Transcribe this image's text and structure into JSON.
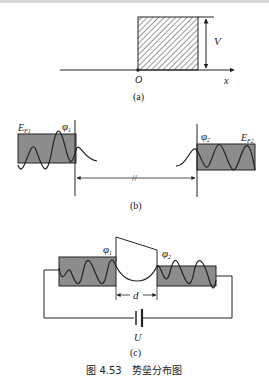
{
  "header_fragment": "",
  "panel_a": {
    "label": "(a)",
    "origin": "O",
    "x_axis": "x",
    "height_label": "V"
  },
  "panel_b": {
    "label": "(b)",
    "left_fermi": "E",
    "left_fermi_sub": "F1",
    "left_work": "φ",
    "left_work_sub": "1",
    "right_fermi": "E",
    "right_fermi_sub": "F2",
    "right_work": "φ",
    "right_work_sub": "2",
    "gap_mark": "//"
  },
  "panel_c": {
    "label": "(c)",
    "phi1": "φ",
    "phi1_sub": "1",
    "phi2": "φ",
    "phi2_sub": "2",
    "gap": "d",
    "voltage": "U"
  },
  "caption": "图 4.53　势垒分布图",
  "colors": {
    "metal_fill": "#8c8c8c",
    "line": "#222222"
  }
}
